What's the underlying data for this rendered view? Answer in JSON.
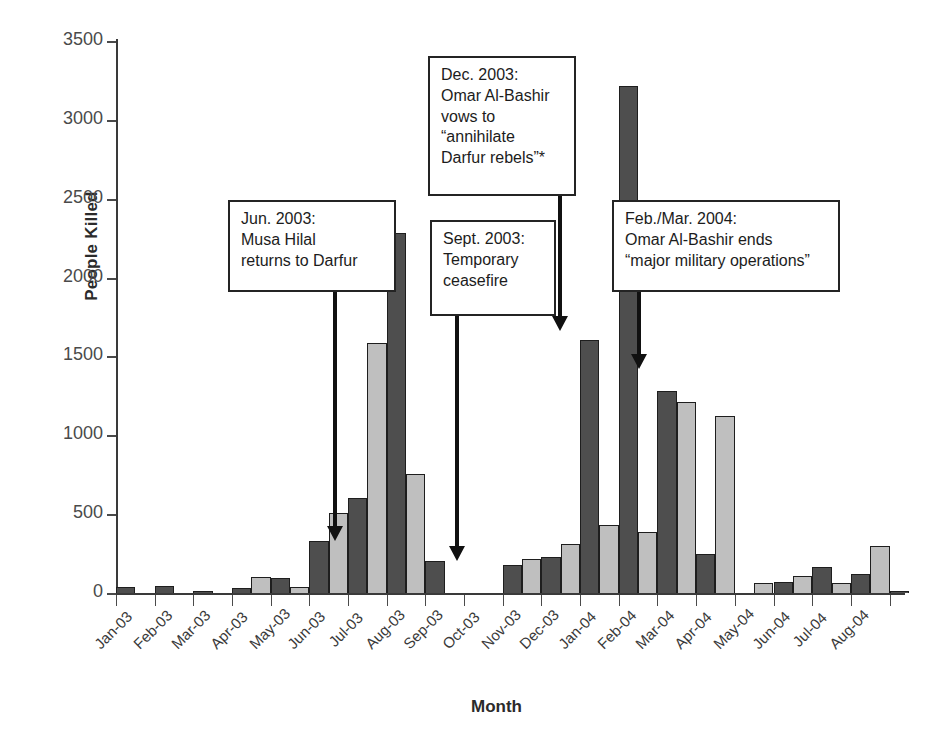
{
  "chart_data": {
    "type": "bar",
    "title": "",
    "xlabel": "Month",
    "ylabel": "People Killed",
    "ylim": [
      0,
      3500
    ],
    "yticks": [
      0,
      500,
      1000,
      1500,
      2000,
      2500,
      3000,
      3500
    ],
    "ytick_labels": [
      "0",
      "500",
      "1000",
      "1500",
      "2000",
      "2500",
      "3000",
      "3500"
    ],
    "grid": false,
    "legend": "none",
    "categories": [
      "Jan-03",
      "Feb-03",
      "Mar-03",
      "Apr-03",
      "May-03",
      "Jun-03",
      "Jul-03",
      "Aug-03",
      "Sep-03",
      "Oct-03",
      "Nov-03",
      "Dec-03",
      "Jan-04",
      "Feb-04",
      "Mar-04",
      "Apr-04",
      "May-04",
      "Jun-04",
      "Jul-04",
      "Aug-04"
    ],
    "series": [
      {
        "name": "dark",
        "color": "#4e4e4e",
        "values": [
          35,
          45,
          5,
          30,
          95,
          330,
          605,
          2280,
          200,
          0,
          180,
          230,
          1605,
          3215,
          1280,
          250,
          0,
          70,
          165,
          120
        ]
      },
      {
        "name": "light",
        "color": "#bfbfbf",
        "values": [
          0,
          0,
          0,
          100,
          40,
          505,
          1585,
          755,
          0,
          0,
          215,
          310,
          430,
          385,
          1210,
          1120,
          65,
          110,
          65,
          300
        ]
      }
    ],
    "tail_values": {
      "label": "Aug-04 trailing",
      "dark": 15
    },
    "annotations": [
      {
        "id": "jun-2003",
        "text": "Jun. 2003:\nMusa Hilal\nreturns to Darfur",
        "points_to": "Jun-03"
      },
      {
        "id": "sept-2003",
        "text": "Sept. 2003:\nTemporary\nceasefire",
        "points_to": "Sep-03"
      },
      {
        "id": "dec-2003",
        "text": "Dec. 2003:\nOmar Al-Bashir\nvows to\n“annihilate\nDarfur rebels”*",
        "points_to": "Dec-03"
      },
      {
        "id": "feb-mar-2004",
        "text": "Feb./Mar. 2004:\nOmar Al-Bashir ends\n“major military operations”",
        "points_to": "Feb-04"
      }
    ]
  }
}
